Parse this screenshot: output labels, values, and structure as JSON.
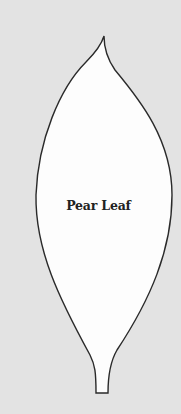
{
  "template": {
    "shape": "pear-leaf-outline",
    "label": "Pear Leaf",
    "colors": {
      "background": "#e3e3e3",
      "leaf_fill": "#fdfdfd",
      "outline": "#2a2a2a",
      "label": "#222222"
    }
  }
}
